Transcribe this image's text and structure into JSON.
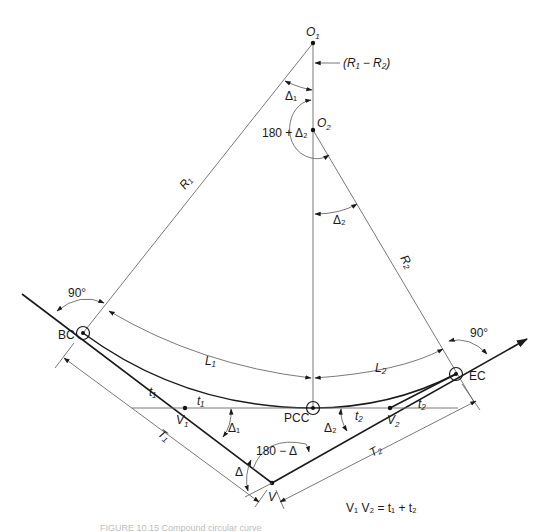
{
  "diagram": {
    "type": "compound-horizontal-curve",
    "points": {
      "O1": {
        "label": "O",
        "sub": "1"
      },
      "O2": {
        "label": "O",
        "sub": "2"
      },
      "BC": {
        "label": "BC"
      },
      "EC": {
        "label": "EC"
      },
      "PCC": {
        "label": "PCC"
      },
      "V": {
        "label": "V"
      },
      "V1": {
        "label": "V",
        "sub": "1"
      },
      "V2": {
        "label": "V",
        "sub": "2"
      }
    },
    "labels": {
      "r1_minus_r2": "(R₁ − R₂)",
      "delta1_top": "Δ₁",
      "angle_180_plus_delta2": "180 + Δ₂",
      "delta2_mid": "Δ₂",
      "R1": "R₁",
      "R2": "R₂",
      "right_angle_bc": "90°",
      "right_angle_ec": "90°",
      "L1": "L₁",
      "L2": "L₂",
      "t1_tangent": "t₁",
      "t1_line": "t₁",
      "t2_line": "t₂",
      "t2_tangent": "t₂",
      "delta1_v1": "Δ₁",
      "delta2_v2": "Δ₂",
      "angle_180_minus_delta": "180 − Δ",
      "delta_v": "Δ",
      "T1": "T₁",
      "T2": "T₂"
    },
    "equation": "V₁ V₂ = t₁ + t₂",
    "caption": "FIGURE 10.15   Compound circular curve"
  }
}
